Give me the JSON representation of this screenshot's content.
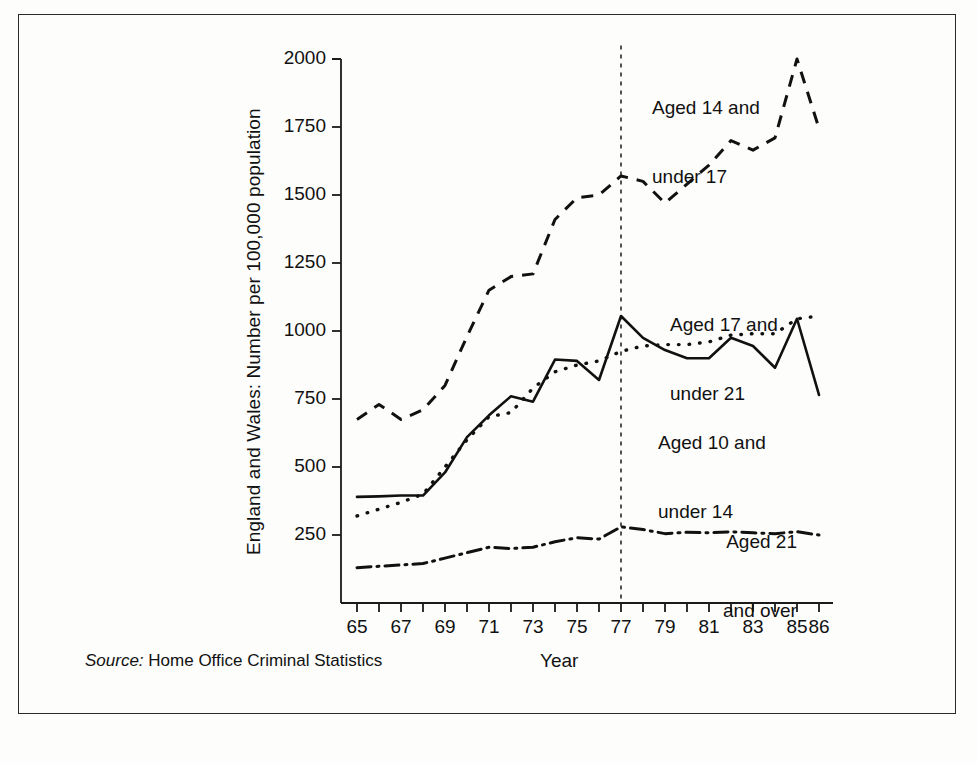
{
  "figure": {
    "ylabel": "England and Wales: Number per 100,000 population",
    "xlabel": "Year",
    "source_prefix": "Source:",
    "source_text": " Home Office Criminal Statistics"
  },
  "annotations": [
    {
      "name": "annotation-aged-14-17",
      "line1": "Aged 14 and",
      "line2": "under 17"
    },
    {
      "name": "annotation-aged-17-21",
      "line1": "Aged 17 and",
      "line2": "under 21"
    },
    {
      "name": "annotation-aged-10-14",
      "line1": "Aged 10 and",
      "line2": "under 14"
    },
    {
      "name": "annotation-aged-21-over",
      "line1": "Aged 21",
      "line2": "and over"
    }
  ],
  "chart_data": {
    "type": "line",
    "title": "",
    "xlabel": "Year",
    "ylabel": "England and Wales: Number per 100,000 population",
    "xlim": [
      65,
      86
    ],
    "ylim": [
      0,
      2000
    ],
    "grid": false,
    "legend_position": "inline-annotations",
    "ytick_values": [
      2000,
      1750,
      1500,
      1250,
      1000,
      750,
      500,
      250
    ],
    "ytick_labels": [
      "2000",
      "1750",
      "1500",
      "1250",
      "1000",
      "750",
      "500",
      "250"
    ],
    "x": [
      65,
      66,
      67,
      68,
      69,
      70,
      71,
      72,
      73,
      74,
      75,
      76,
      77,
      78,
      79,
      80,
      81,
      82,
      83,
      84,
      85,
      86
    ],
    "xtick_values": [
      65,
      66,
      67,
      68,
      69,
      70,
      71,
      72,
      73,
      74,
      75,
      76,
      77,
      78,
      79,
      80,
      81,
      82,
      83,
      84,
      85,
      86
    ],
    "xtick_labels": [
      "65",
      "",
      "67",
      "",
      "69",
      "",
      "71",
      "",
      "73",
      "",
      "75",
      "",
      "77",
      "",
      "79",
      "",
      "81",
      "",
      "83",
      "",
      "85",
      "86"
    ],
    "reference_line": {
      "x": 77,
      "style": "dotted",
      "label": ""
    },
    "series": [
      {
        "name": "Aged 14 and under 17",
        "style": "dashed",
        "values": [
          675,
          730,
          675,
          710,
          800,
          980,
          1150,
          1200,
          1210,
          1410,
          1490,
          1500,
          1570,
          1550,
          1470,
          1540,
          1610,
          1700,
          1665,
          1710,
          2000,
          1745
        ]
      },
      {
        "name": "Aged 10 and under 14",
        "style": "solid",
        "values": [
          390,
          392,
          395,
          395,
          480,
          610,
          690,
          760,
          740,
          895,
          890,
          820,
          1055,
          975,
          930,
          900,
          900,
          975,
          945,
          865,
          1045,
          765
        ]
      },
      {
        "name": "Aged 17 and under 21",
        "style": "dotted",
        "values": [
          320,
          345,
          370,
          400,
          500,
          600,
          685,
          700,
          790,
          850,
          875,
          890,
          925,
          945,
          950,
          950,
          960,
          985,
          990,
          990,
          1045,
          1055
        ]
      },
      {
        "name": "Aged 21 and over",
        "style": "dashdot",
        "values": [
          130,
          135,
          140,
          145,
          165,
          185,
          205,
          200,
          205,
          225,
          240,
          235,
          280,
          270,
          255,
          260,
          258,
          262,
          258,
          255,
          262,
          250
        ]
      }
    ]
  }
}
